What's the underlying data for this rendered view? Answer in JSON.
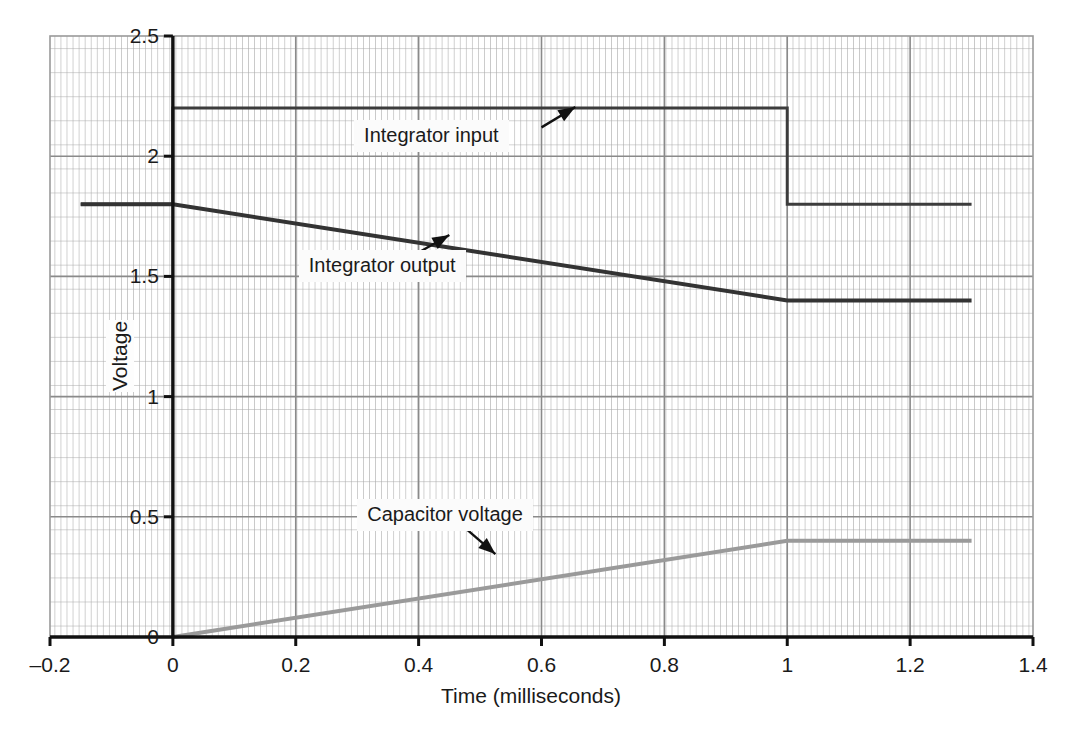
{
  "chart_data": {
    "type": "line",
    "title": "",
    "xlabel": "Time (milliseconds)",
    "ylabel": "Voltage",
    "xlim": [
      -0.2,
      1.4
    ],
    "ylim": [
      0,
      2.5
    ],
    "grid": true,
    "grid_style": "fine engineering graph paper: dense vertical minor lines, horizontal minor lines",
    "legend_position": "none (inline annotations with arrows)",
    "x_ticks": [
      "-0.2",
      "0",
      "0.2",
      "0.4",
      "0.6",
      "0.8",
      "1",
      "1.2",
      "1.4"
    ],
    "x_tick_values": [
      -0.2,
      0,
      0.2,
      0.4,
      0.6,
      0.8,
      1.0,
      1.2,
      1.4
    ],
    "y_ticks": [
      "0",
      "0.5",
      "1",
      "1.5",
      "2",
      "2.5"
    ],
    "y_tick_values": [
      0,
      0.5,
      1,
      1.5,
      2,
      2.5
    ],
    "series": [
      {
        "name": "Integrator input",
        "color": "#3c3c3c",
        "width": 3,
        "points": [
          [
            -0.15,
            1.8
          ],
          [
            0.0,
            1.8
          ],
          [
            0.0,
            2.2
          ],
          [
            1.0,
            2.2
          ],
          [
            1.0,
            1.8
          ],
          [
            1.3,
            1.8
          ]
        ]
      },
      {
        "name": "Integrator output",
        "color": "#333333",
        "width": 4,
        "points": [
          [
            -0.15,
            1.8
          ],
          [
            0.0,
            1.8
          ],
          [
            1.0,
            1.4
          ],
          [
            1.3,
            1.4
          ]
        ]
      },
      {
        "name": "Capacitor voltage",
        "color": "#9a9a9a",
        "width": 4,
        "points": [
          [
            0.0,
            0.0
          ],
          [
            1.0,
            0.4
          ],
          [
            1.3,
            0.4
          ]
        ]
      }
    ],
    "annotations": [
      {
        "text": "Integrator input",
        "label_x": 0.295,
        "label_y": 2.082,
        "arrow_from": [
          0.6,
          2.12
        ],
        "arrow_to": [
          0.655,
          2.205
        ]
      },
      {
        "text": "Integrator output",
        "label_x": 0.205,
        "label_y": 1.545,
        "arrow_from": [
          0.395,
          1.592
        ],
        "arrow_to": [
          0.45,
          1.672
        ]
      },
      {
        "text": "Capacitor voltage",
        "label_x": 0.3,
        "label_y": 0.508,
        "arrow_from": [
          0.475,
          0.455
        ],
        "arrow_to": [
          0.525,
          0.345
        ]
      }
    ]
  },
  "axes": {
    "x_title": "Time (milliseconds)",
    "y_title": "Voltage"
  }
}
